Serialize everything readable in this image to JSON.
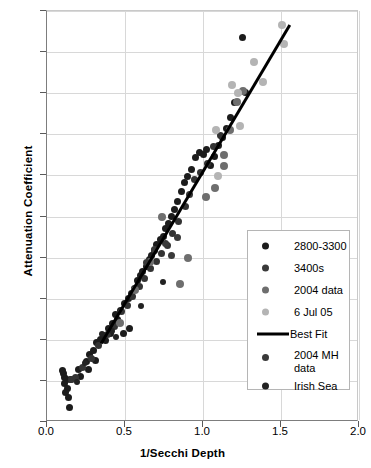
{
  "chart_data": {
    "type": "scatter",
    "title": "",
    "xlabel": "1/Secchi Depth",
    "ylabel": "Attenuation Coefficient",
    "xlim": [
      0.0,
      2.0
    ],
    "ylim": [
      0.0,
      2.0
    ],
    "xticks": [
      "0.0",
      "0.5",
      "1.0",
      "1.5",
      "2.0"
    ],
    "yticks": [
      "0.0",
      "0.2",
      "0.4",
      "0.6",
      "0.8",
      "1.0",
      "1.2",
      "1.4",
      "1.6",
      "1.8",
      "2.0"
    ],
    "grid": true,
    "legend_position": "lower-right-inside",
    "series": [
      {
        "name": "2800-3300",
        "color": "#1c1c1c",
        "marker_size": 7,
        "points": [
          [
            0.105,
            0.235
          ],
          [
            0.115,
            0.215
          ],
          [
            0.125,
            0.205
          ],
          [
            0.11,
            0.185
          ],
          [
            0.13,
            0.165
          ],
          [
            0.12,
            0.145
          ],
          [
            0.135,
            0.12
          ],
          [
            0.145,
            0.072
          ],
          [
            0.1,
            0.25
          ],
          [
            0.15,
            0.205
          ],
          [
            0.215,
            0.22
          ],
          [
            0.255,
            0.295
          ],
          [
            0.27,
            0.33
          ],
          [
            0.3,
            0.35
          ],
          [
            0.32,
            0.385
          ],
          [
            0.345,
            0.4
          ],
          [
            0.36,
            0.42
          ],
          [
            0.375,
            0.395
          ],
          [
            0.395,
            0.455
          ],
          [
            0.405,
            0.43
          ],
          [
            0.42,
            0.48
          ],
          [
            0.44,
            0.525
          ],
          [
            0.455,
            0.5
          ],
          [
            0.47,
            0.545
          ],
          [
            0.495,
            0.575
          ],
          [
            0.52,
            0.6
          ],
          [
            0.54,
            0.625
          ],
          [
            0.56,
            0.65
          ],
          [
            0.58,
            0.69
          ],
          [
            0.6,
            0.715
          ],
          [
            0.615,
            0.73
          ],
          [
            0.635,
            0.755
          ],
          [
            0.655,
            0.79
          ],
          [
            0.67,
            0.81
          ],
          [
            0.69,
            0.835
          ],
          [
            0.705,
            0.865
          ],
          [
            0.725,
            0.89
          ],
          [
            0.745,
            0.905
          ],
          [
            0.76,
            0.94
          ],
          [
            0.78,
            0.965
          ],
          [
            0.795,
            1.0
          ],
          [
            0.815,
            1.035
          ],
          [
            0.835,
            1.075
          ],
          [
            0.86,
            1.12
          ],
          [
            0.88,
            1.165
          ],
          [
            0.9,
            1.195
          ],
          [
            0.925,
            1.23
          ],
          [
            0.95,
            1.285
          ],
          [
            0.975,
            1.31
          ],
          [
            1.0,
            1.3
          ],
          [
            1.025,
            1.325
          ],
          [
            1.05,
            1.25
          ],
          [
            1.075,
            1.29
          ],
          [
            1.1,
            1.345
          ],
          [
            1.125,
            1.385
          ],
          [
            1.15,
            1.43
          ],
          [
            1.175,
            1.48
          ],
          [
            1.2,
            1.555
          ],
          [
            1.25,
            1.87
          ],
          [
            1.27,
            1.605
          ],
          [
            0.49,
            0.43
          ],
          [
            0.53,
            0.455
          ],
          [
            0.31,
            0.3
          ],
          [
            0.265,
            0.255
          ],
          [
            0.2,
            0.255
          ]
        ]
      },
      {
        "name": "3400s",
        "color": "#333333",
        "marker_size": 7,
        "points": [
          [
            0.155,
            0.205
          ],
          [
            0.185,
            0.215
          ],
          [
            0.23,
            0.265
          ],
          [
            0.285,
            0.31
          ],
          [
            0.33,
            0.37
          ],
          [
            0.385,
            0.425
          ],
          [
            0.43,
            0.465
          ],
          [
            0.48,
            0.54
          ],
          [
            0.515,
            0.565
          ],
          [
            0.55,
            0.61
          ],
          [
            0.59,
            0.66
          ],
          [
            0.625,
            0.7
          ],
          [
            0.665,
            0.745
          ],
          [
            0.7,
            0.78
          ],
          [
            0.735,
            0.82
          ],
          [
            0.77,
            0.86
          ],
          [
            0.805,
            0.915
          ],
          [
            0.845,
            0.975
          ],
          [
            0.885,
            1.05
          ],
          [
            0.915,
            1.105
          ],
          [
            0.945,
            1.18
          ],
          [
            0.985,
            1.215
          ],
          [
            1.03,
            1.26
          ],
          [
            1.07,
            1.34
          ],
          [
            1.115,
            1.395
          ]
        ]
      },
      {
        "name": "2004 data",
        "color": "#6e6e6e",
        "marker_size": 8,
        "points": [
          [
            0.735,
            1.0
          ],
          [
            0.85,
            0.67
          ],
          [
            0.905,
            0.8
          ],
          [
            1.02,
            1.095
          ],
          [
            1.08,
            1.14
          ],
          [
            1.135,
            1.3
          ],
          [
            1.175,
            1.42
          ],
          [
            1.215,
            1.555
          ],
          [
            1.255,
            1.61
          ],
          [
            0.47,
            0.48
          ],
          [
            0.565,
            0.64
          ],
          [
            0.66,
            0.78
          ],
          [
            1.135,
            1.245
          ]
        ]
      },
      {
        "name": "6 Jul 05",
        "color": "#b4b4b4",
        "marker_size": 8,
        "points": [
          [
            1.085,
            1.42
          ],
          [
            1.185,
            1.64
          ],
          [
            1.225,
            1.6
          ],
          [
            1.33,
            1.75
          ],
          [
            1.385,
            1.655
          ],
          [
            1.505,
            1.93
          ],
          [
            1.52,
            1.84
          ],
          [
            1.235,
            1.44
          ],
          [
            1.095,
            1.195
          ]
        ]
      },
      {
        "name": "2004 MH data",
        "color": "#3a3a3a",
        "marker_size": 7,
        "points": [
          [
            0.64,
            0.775
          ],
          [
            0.69,
            0.84
          ],
          [
            0.76,
            0.87
          ],
          [
            0.8,
            0.81
          ],
          [
            0.835,
            0.9
          ]
        ]
      },
      {
        "name": "Irish Sea",
        "color": "#222222",
        "marker_size": 6,
        "points": [
          [
            0.19,
            0.195
          ],
          [
            0.245,
            0.285
          ],
          [
            0.355,
            0.43
          ],
          [
            0.415,
            0.445
          ],
          [
            0.445,
            0.415
          ],
          [
            0.6,
            0.565
          ],
          [
            0.745,
            0.68
          ]
        ]
      }
    ],
    "best_fit": {
      "name": "Best Fit",
      "color": "#000000",
      "x0": 0.345,
      "y0": 0.385,
      "x1": 1.555,
      "y1": 1.935
    }
  },
  "legend": {
    "entries": [
      {
        "label": "2800-3300",
        "type": "marker",
        "color": "#1c1c1c"
      },
      {
        "label": "3400s",
        "type": "marker",
        "color": "#3a3a3a"
      },
      {
        "label": "2004 data",
        "type": "marker",
        "color": "#6e6e6e"
      },
      {
        "label": "6 Jul 05",
        "type": "marker",
        "color": "#b4b4b4"
      },
      {
        "label": "Best Fit",
        "type": "line",
        "color": "#000000"
      },
      {
        "label": "2004 MH",
        "label2": "data",
        "type": "marker",
        "color": "#3a3a3a"
      },
      {
        "label": "Irish Sea",
        "type": "marker",
        "color": "#222222"
      }
    ]
  }
}
